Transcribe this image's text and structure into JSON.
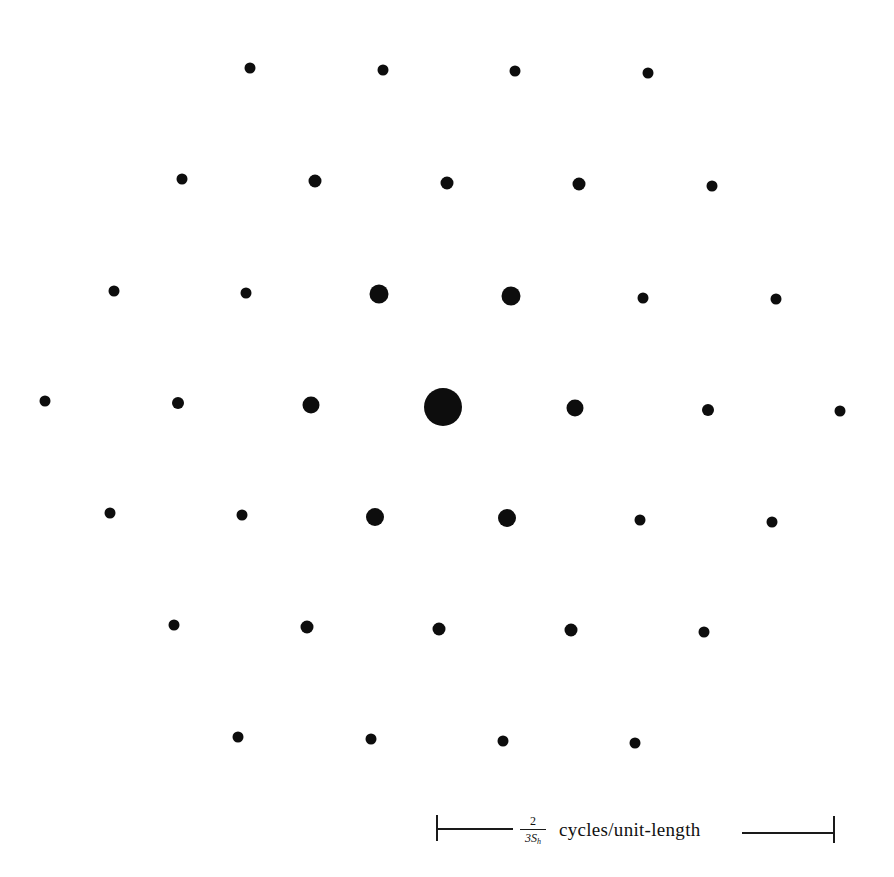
{
  "figure": {
    "dot_color": "#0d0d0d",
    "background": "#ffffff",
    "rows": [
      {
        "y_row": 1,
        "dots": [
          {
            "x": 250,
            "y": 68,
            "d": 11
          },
          {
            "x": 383,
            "y": 70,
            "d": 11
          },
          {
            "x": 515,
            "y": 71,
            "d": 11
          },
          {
            "x": 648,
            "y": 73,
            "d": 11
          }
        ]
      },
      {
        "y_row": 2,
        "dots": [
          {
            "x": 182,
            "y": 179,
            "d": 11
          },
          {
            "x": 315,
            "y": 181,
            "d": 13
          },
          {
            "x": 447,
            "y": 183,
            "d": 13
          },
          {
            "x": 579,
            "y": 184,
            "d": 13
          },
          {
            "x": 712,
            "y": 186,
            "d": 11
          }
        ]
      },
      {
        "y_row": 3,
        "dots": [
          {
            "x": 114,
            "y": 291,
            "d": 11
          },
          {
            "x": 246,
            "y": 293,
            "d": 11
          },
          {
            "x": 379,
            "y": 294,
            "d": 19
          },
          {
            "x": 511,
            "y": 296,
            "d": 19
          },
          {
            "x": 643,
            "y": 298,
            "d": 11
          },
          {
            "x": 776,
            "y": 299,
            "d": 11
          }
        ]
      },
      {
        "y_row": 4,
        "dots": [
          {
            "x": 45,
            "y": 401,
            "d": 11
          },
          {
            "x": 178,
            "y": 403,
            "d": 12
          },
          {
            "x": 311,
            "y": 405,
            "d": 17
          },
          {
            "x": 443,
            "y": 407,
            "d": 38
          },
          {
            "x": 575,
            "y": 408,
            "d": 17
          },
          {
            "x": 708,
            "y": 410,
            "d": 12
          },
          {
            "x": 840,
            "y": 411,
            "d": 11
          }
        ]
      },
      {
        "y_row": 5,
        "dots": [
          {
            "x": 110,
            "y": 513,
            "d": 11
          },
          {
            "x": 242,
            "y": 515,
            "d": 11
          },
          {
            "x": 375,
            "y": 517,
            "d": 18
          },
          {
            "x": 507,
            "y": 518,
            "d": 18
          },
          {
            "x": 640,
            "y": 520,
            "d": 11
          },
          {
            "x": 772,
            "y": 522,
            "d": 11
          }
        ]
      },
      {
        "y_row": 6,
        "dots": [
          {
            "x": 174,
            "y": 625,
            "d": 11
          },
          {
            "x": 307,
            "y": 627,
            "d": 13
          },
          {
            "x": 439,
            "y": 629,
            "d": 13
          },
          {
            "x": 571,
            "y": 630,
            "d": 13
          },
          {
            "x": 704,
            "y": 632,
            "d": 11
          }
        ]
      },
      {
        "y_row": 7,
        "dots": [
          {
            "x": 238,
            "y": 737,
            "d": 11
          },
          {
            "x": 371,
            "y": 739,
            "d": 11
          },
          {
            "x": 503,
            "y": 741,
            "d": 11
          },
          {
            "x": 635,
            "y": 743,
            "d": 11
          }
        ]
      }
    ]
  },
  "scale_bar": {
    "fraction_numerator": "2",
    "fraction_denominator_base": "3S",
    "fraction_denominator_sub": "h",
    "unit_label": "cycles/unit-length",
    "left_x": 437,
    "right_x": 834
  }
}
